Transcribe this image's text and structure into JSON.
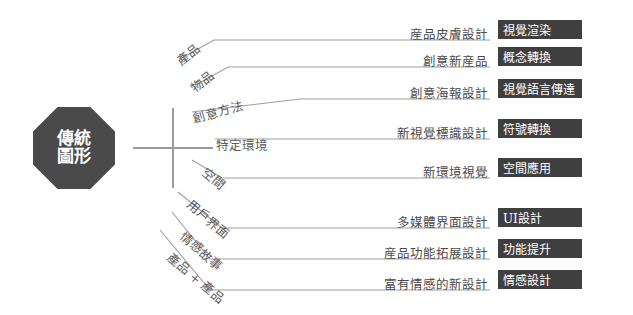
{
  "root": {
    "line1": "傳統",
    "line2": "圖形",
    "operator": "plus"
  },
  "colors": {
    "root_fill": "#4a4a4a",
    "badge_fill": "#3f3f3f",
    "line": "#9e9e9e",
    "text": "#4a4a4a",
    "background": "#ffffff"
  },
  "rows": [
    {
      "category": "產品",
      "description": "産品皮膚設計",
      "badge": "視覺渲染",
      "y_line": 40,
      "rotated": true,
      "angle": -38
    },
    {
      "category": "物品",
      "description": "創意新産品",
      "badge": "概念轉換",
      "y_line": 67,
      "rotated": true,
      "angle": -38
    },
    {
      "category": "創意方法",
      "description": "創意海報設計",
      "badge": "視覺語言傳達",
      "y_line": 99,
      "rotated": true,
      "angle": -22
    },
    {
      "category": "特定環境",
      "description": "新視覺標識設計",
      "badge": "符號轉換",
      "y_line": 139,
      "rotated": false,
      "angle": 0
    },
    {
      "category": "空間",
      "description": "新環境視覺",
      "badge": "空間應用",
      "y_line": 178,
      "rotated": true,
      "angle": 40
    },
    {
      "category": "用戶界面",
      "description": "多媒體界面設計",
      "badge": "UI設計",
      "y_line": 228,
      "rotated": true,
      "angle": 40
    },
    {
      "category": "情感故事",
      "description": "産品功能拓展設計",
      "badge": "功能提升",
      "y_line": 259,
      "rotated": true,
      "angle": 40
    },
    {
      "category": "產品 + 產品",
      "description": "富有情感的新設計",
      "badge": "情感設計",
      "y_line": 290,
      "rotated": true,
      "angle": 40
    }
  ]
}
